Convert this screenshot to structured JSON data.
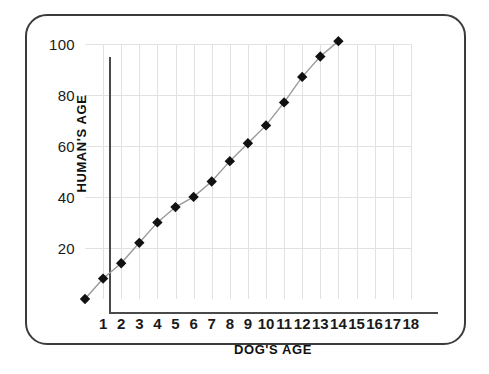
{
  "chart_data": {
    "type": "line",
    "title": "",
    "subtitle": "",
    "xlabel": "DOG'S AGE",
    "ylabel": "HUMAN'S AGE",
    "xlim": [
      0,
      18
    ],
    "ylim": [
      0,
      105
    ],
    "grid": true,
    "legend": "none",
    "marker": "filled-diamond",
    "marker_color": "#111111",
    "line_color": "#9a9a9a",
    "grid_color": "#e2e2e2",
    "axis_color": "#4a4a4a",
    "xticks": [
      1,
      2,
      3,
      4,
      5,
      6,
      7,
      8,
      9,
      10,
      11,
      12,
      13,
      14,
      15,
      16,
      17,
      18
    ],
    "xtick_labels": [
      "1",
      "2",
      "3",
      "4",
      "5",
      "6",
      "7",
      "8",
      "9",
      "10",
      "11",
      "12",
      "13",
      "14",
      "15",
      "16",
      "17",
      "18"
    ],
    "yticks": [
      20,
      40,
      60,
      80,
      100
    ],
    "ytick_labels": [
      "20",
      "40",
      "60",
      "80",
      "100"
    ],
    "x": [
      0,
      1,
      2,
      3,
      4,
      5,
      6,
      7,
      8,
      9,
      10,
      11,
      12,
      13,
      14
    ],
    "values": [
      0,
      8,
      14,
      22,
      30,
      36,
      40,
      46,
      54,
      61,
      68,
      77,
      87,
      95,
      101
    ],
    "series": [
      {
        "name": "Dog age to human age",
        "x": [
          0,
          1,
          2,
          3,
          4,
          5,
          6,
          7,
          8,
          9,
          10,
          11,
          12,
          13,
          14
        ],
        "values": [
          0,
          8,
          14,
          22,
          30,
          36,
          40,
          46,
          54,
          61,
          68,
          77,
          87,
          95,
          101
        ]
      }
    ]
  },
  "frame": {
    "border_color": "#3b3b3b"
  }
}
